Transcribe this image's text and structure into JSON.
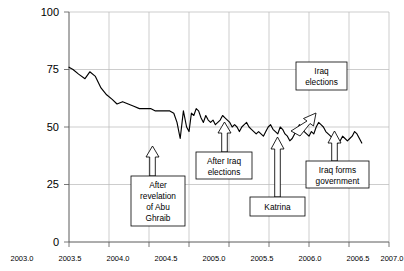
{
  "chart_data": {
    "type": "line",
    "title": "",
    "xlabel": "",
    "ylabel": "",
    "xlim": [
      2003.0,
      2007.0
    ],
    "ylim": [
      0,
      100
    ],
    "grid": true,
    "legend": "none",
    "ytick_labels": [
      "0",
      "25",
      "50",
      "75",
      "100"
    ],
    "ytick_values": [
      0,
      25,
      50,
      75,
      100
    ],
    "xtick_labels": [
      "2003.0",
      "2003.5",
      "2004.0",
      "2004.5",
      "2005.0",
      "2005.5",
      "2006.0",
      "2006.5",
      "2007.0"
    ],
    "xtick_values": [
      2003.0,
      2003.5,
      2004.0,
      2004.5,
      2005.0,
      2005.5,
      2006.0,
      2006.5,
      2007.0
    ],
    "series": [
      {
        "name": "Approval rating",
        "x": [
          2003.0,
          2003.05,
          2003.12,
          2003.2,
          2003.26,
          2003.33,
          2003.4,
          2003.47,
          2003.54,
          2003.6,
          2003.67,
          2003.74,
          2003.81,
          2003.88,
          2003.95,
          2004.02,
          2004.08,
          2004.14,
          2004.2,
          2004.26,
          2004.31,
          2004.35,
          2004.39,
          2004.43,
          2004.47,
          2004.5,
          2004.53,
          2004.56,
          2004.59,
          2004.62,
          2004.65,
          2004.68,
          2004.71,
          2004.74,
          2004.77,
          2004.8,
          2004.83,
          2004.86,
          2004.89,
          2004.92,
          2004.95,
          2004.98,
          2005.01,
          2005.04,
          2005.07,
          2005.1,
          2005.13,
          2005.16,
          2005.19,
          2005.22,
          2005.25,
          2005.28,
          2005.31,
          2005.34,
          2005.37,
          2005.4,
          2005.43,
          2005.46,
          2005.49,
          2005.52,
          2005.55,
          2005.58,
          2005.61,
          2005.64,
          2005.67,
          2005.7,
          2005.73,
          2005.76,
          2005.79,
          2005.82,
          2005.85,
          2005.88,
          2005.91,
          2005.94,
          2005.97,
          2006.0,
          2006.03,
          2006.06,
          2006.09,
          2006.12,
          2006.15,
          2006.18,
          2006.21,
          2006.24,
          2006.27,
          2006.3,
          2006.33,
          2006.36,
          2006.39,
          2006.42,
          2006.45,
          2006.48,
          2006.51,
          2006.54,
          2006.57,
          2006.6,
          2006.63,
          2006.66
        ],
        "y": [
          76,
          75,
          73,
          71,
          74,
          72,
          67,
          64,
          62,
          60,
          61,
          60,
          59,
          58,
          58,
          58,
          57,
          57,
          57,
          57,
          56,
          52,
          45,
          57,
          50,
          48,
          56,
          55,
          58,
          57,
          54,
          52,
          55,
          53,
          52,
          53,
          51,
          52,
          53,
          55,
          54,
          53,
          52,
          50,
          51,
          50,
          48,
          50,
          51,
          52,
          50,
          49,
          48,
          47,
          48,
          47,
          46,
          48,
          50,
          51,
          49,
          48,
          47,
          50,
          49,
          47,
          46,
          44,
          45,
          47,
          49,
          51,
          50,
          48,
          47,
          46,
          48,
          47,
          50,
          52,
          51,
          50,
          48,
          47,
          46,
          45,
          44,
          43,
          44,
          46,
          45,
          44,
          45,
          46,
          48,
          47,
          45,
          43
        ],
        "color": "#000000"
      }
    ],
    "annotations": [
      {
        "id": "abu-ghraib",
        "lines": [
          "After",
          "revelation",
          "of Abu",
          "Ghraib"
        ],
        "arrow": "up",
        "points_to_year": 2004.38
      },
      {
        "id": "after-iraq-elections",
        "lines": [
          "After Iraq",
          "elections"
        ],
        "arrow": "up",
        "points_to_year": 2005.02
      },
      {
        "id": "katrina",
        "lines": [
          "Katrina"
        ],
        "arrow": "up",
        "points_to_year": 2005.7
      },
      {
        "id": "iraq-elections",
        "lines": [
          "Iraq",
          "elections"
        ],
        "arrow": "diagonal-down-left",
        "points_to_year": 2006.02
      },
      {
        "id": "iraq-forms-government",
        "lines": [
          "Iraq forms",
          "government"
        ],
        "arrow": "up",
        "points_to_year": 2006.45
      }
    ]
  }
}
